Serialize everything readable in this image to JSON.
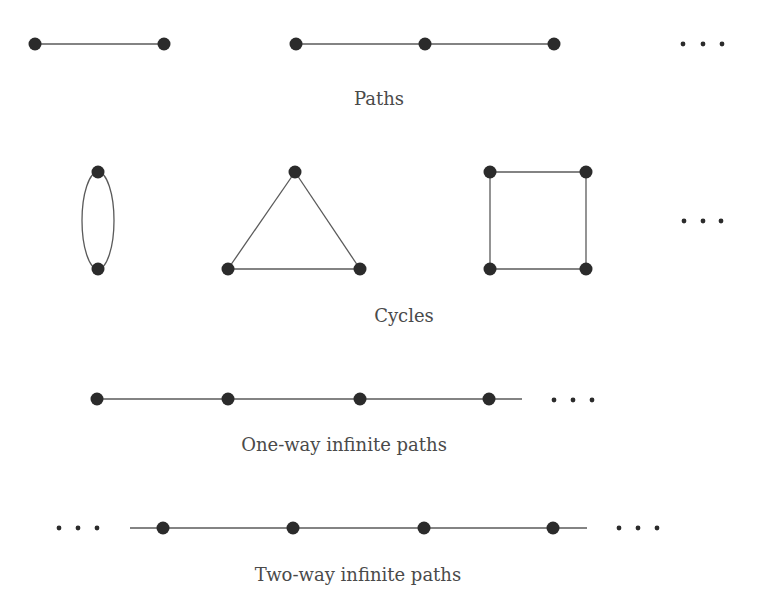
{
  "style": {
    "node_color": "#2b2b2b",
    "edge_color": "#5a5a5a",
    "dot_color": "#2b2b2b",
    "caption_color": "#4a4a4a",
    "node_radius": 6.5,
    "dot_radius": 2.4
  },
  "sections": [
    {
      "id": "paths",
      "caption": "Paths",
      "caption_pos": {
        "x": 379,
        "y": 88
      },
      "graphs": [
        {
          "name": "path-p2",
          "nodes": [
            [
              35,
              44
            ],
            [
              164,
              44
            ]
          ],
          "edges": [
            [
              0,
              1
            ]
          ]
        },
        {
          "name": "path-p3",
          "nodes": [
            [
              296,
              44
            ],
            [
              425,
              44
            ],
            [
              554,
              44
            ]
          ],
          "edges": [
            [
              0,
              1
            ],
            [
              1,
              2
            ]
          ]
        }
      ],
      "ellipses": [
        {
          "name": "paths-ellipsis",
          "dots": [
            [
              683,
              44
            ],
            [
              703,
              44
            ],
            [
              722,
              44
            ]
          ]
        }
      ]
    },
    {
      "id": "cycles",
      "caption": "Cycles",
      "caption_pos": {
        "x": 404,
        "y": 305
      },
      "graphs": [
        {
          "name": "cycle-c2",
          "nodes": [
            [
              98,
              172
            ],
            [
              98,
              269
            ]
          ],
          "curved": true
        },
        {
          "name": "cycle-c3",
          "nodes": [
            [
              295,
              172
            ],
            [
              228,
              269
            ],
            [
              360,
              269
            ]
          ],
          "edges": [
            [
              0,
              1
            ],
            [
              1,
              2
            ],
            [
              2,
              0
            ]
          ]
        },
        {
          "name": "cycle-c4",
          "nodes": [
            [
              490,
              172
            ],
            [
              586,
              172
            ],
            [
              586,
              269
            ],
            [
              490,
              269
            ]
          ],
          "edges": [
            [
              0,
              1
            ],
            [
              1,
              2
            ],
            [
              2,
              3
            ],
            [
              3,
              0
            ]
          ]
        }
      ],
      "ellipses": [
        {
          "name": "cycles-ellipsis",
          "dots": [
            [
              684,
              221
            ],
            [
              703,
              221
            ],
            [
              721,
              221
            ]
          ]
        }
      ]
    },
    {
      "id": "one-way",
      "caption": "One-way infinite paths",
      "caption_pos": {
        "x": 344,
        "y": 434
      },
      "graphs": [
        {
          "name": "one-way-path",
          "nodes": [
            [
              97,
              399
            ],
            [
              228,
              399
            ],
            [
              360,
              399
            ],
            [
              489,
              399
            ]
          ],
          "edges": [
            [
              0,
              1
            ],
            [
              1,
              2
            ],
            [
              2,
              3
            ]
          ],
          "tail_right": 522
        }
      ],
      "ellipses": [
        {
          "name": "one-way-ellipsis",
          "dots": [
            [
              554,
              400
            ],
            [
              573,
              400
            ],
            [
              592,
              400
            ]
          ]
        }
      ]
    },
    {
      "id": "two-way",
      "caption": "Two-way infinite paths",
      "caption_pos": {
        "x": 358,
        "y": 564
      },
      "graphs": [
        {
          "name": "two-way-path",
          "nodes": [
            [
              163,
              528
            ],
            [
              293,
              528
            ],
            [
              424,
              528
            ],
            [
              553,
              528
            ]
          ],
          "edges": [
            [
              0,
              1
            ],
            [
              1,
              2
            ],
            [
              2,
              3
            ]
          ],
          "tail_left": 130,
          "tail_right": 587
        }
      ],
      "ellipses": [
        {
          "name": "two-way-left-ellipsis",
          "dots": [
            [
              59,
              528
            ],
            [
              78,
              528
            ],
            [
              97,
              528
            ]
          ]
        },
        {
          "name": "two-way-right-ellipsis",
          "dots": [
            [
              619,
              528
            ],
            [
              638,
              528
            ],
            [
              657,
              528
            ]
          ]
        }
      ]
    }
  ]
}
